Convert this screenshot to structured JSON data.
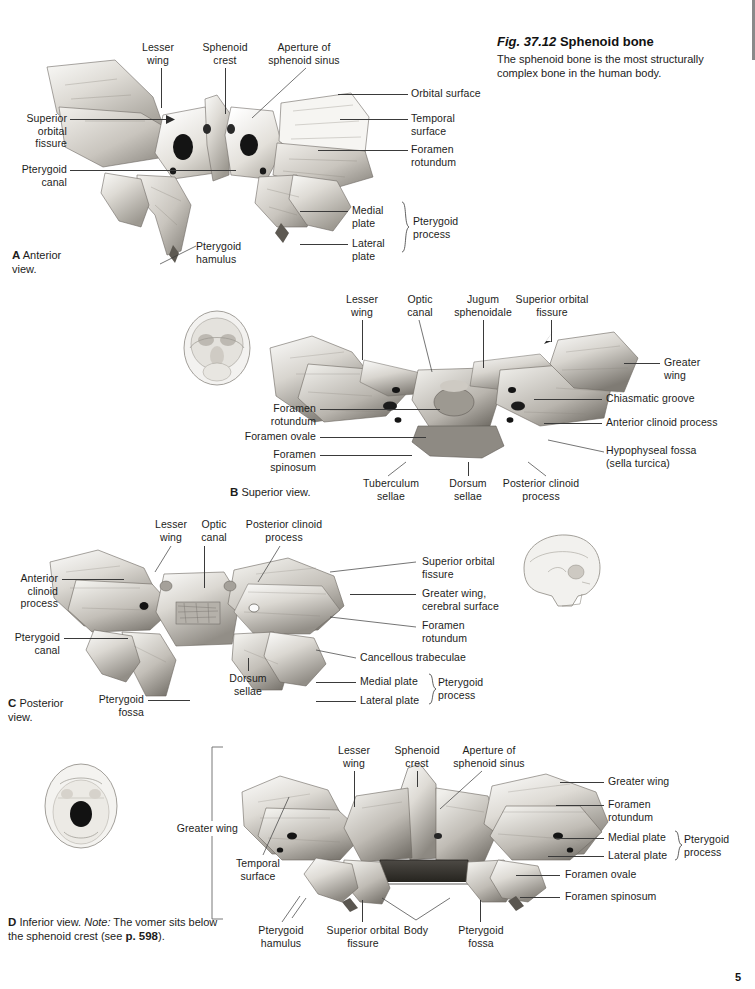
{
  "figure": {
    "number": "Fig. 37.12",
    "title": "Sphenoid bone",
    "caption": "The sphenoid bone is the most structurally complex bone in the human body."
  },
  "page_marker": "5",
  "panels": {
    "a": {
      "letter": "A",
      "caption": "Anterior\nview.",
      "labels": {
        "lesser_wing": "Lesser\nwing",
        "sphenoid_crest": "Sphenoid\ncrest",
        "aperture": "Aperture of\nsphenoid sinus",
        "superior_orbital_fissure": "Superior\norbital\nfissure",
        "pterygoid_canal": "Pterygoid\ncanal",
        "pterygoid_hamulus": "Pterygoid\nhamulus",
        "orbital_surface": "Orbital surface",
        "temporal_surface": "Temporal\nsurface",
        "foramen_rotundum": "Foramen\nrotundum",
        "medial_plate": "Medial\nplate",
        "lateral_plate": "Lateral\nplate",
        "pterygoid_process": "Pterygoid\nprocess"
      }
    },
    "b": {
      "letter": "B",
      "caption": "Superior view.",
      "labels": {
        "lesser_wing": "Lesser\nwing",
        "optic_canal": "Optic\ncanal",
        "jugum_sphenoidale": "Jugum\nsphenoidale",
        "superior_orbital_fissure": "Superior orbital\nfissure",
        "greater_wing": "Greater\nwing",
        "chiasmatic_groove": "Chiasmatic groove",
        "anterior_clinoid_process": "Anterior clinoid process",
        "hypophyseal_fossa": "Hypophyseal fossa\n(sella turcica)",
        "foramen_rotundum": "Foramen\nrotundum",
        "foramen_ovale": "Foramen ovale",
        "foramen_spinosum": "Foramen\nspinosum",
        "tuberculum_sellae": "Tuberculum\nsellae",
        "dorsum_sellae": "Dorsum\nsellae",
        "posterior_clinoid_process": "Posterior clinoid\nprocess"
      }
    },
    "c": {
      "letter": "C",
      "caption": "Posterior\nview.",
      "labels": {
        "lesser_wing": "Lesser\nwing",
        "optic_canal": "Optic\ncanal",
        "posterior_clinoid_process": "Posterior clinoid\nprocess",
        "anterior_clinoid_process": "Anterior\nclinoid\nprocess",
        "pterygoid_canal": "Pterygoid\ncanal",
        "pterygoid_fossa": "Pterygoid\nfossa",
        "dorsum_sellae": "Dorsum\nsellae",
        "superior_orbital_fissure": "Superior orbital\nfissure",
        "greater_wing_cerebral": "Greater wing,\ncerebral surface",
        "foramen_rotundum": "Foramen\nrotundum",
        "cancellous_trabeculae": "Cancellous trabeculae",
        "medial_plate": "Medial plate",
        "lateral_plate": "Lateral plate",
        "pterygoid_process": "Pterygoid\nprocess"
      }
    },
    "d": {
      "letter": "D",
      "caption_part1": "Inferior view. ",
      "caption_note": "Note:",
      "caption_part2": " The vomer sits below the sphenoid crest (see ",
      "caption_page": "p. 598",
      "caption_end": ").",
      "labels": {
        "lesser_wing": "Lesser\nwing",
        "sphenoid_crest": "Sphenoid\ncrest",
        "aperture": "Aperture of\nsphenoid sinus",
        "greater_wing_left": "Greater wing",
        "temporal_surface": "Temporal\nsurface",
        "greater_wing_right": "Greater wing",
        "foramen_rotundum": "Foramen\nrotundum",
        "medial_plate": "Medial plate",
        "lateral_plate": "Lateral plate",
        "pterygoid_process": "Pterygoid\nprocess",
        "foramen_ovale": "Foramen ovale",
        "foramen_spinosum": "Foramen spinosum",
        "pterygoid_hamulus": "Pterygoid\nhamulus",
        "superior_orbital_fissure": "Superior orbital\nfissure",
        "body": "Body",
        "pterygoid_fossa": "Pterygoid\nfossa"
      }
    }
  }
}
